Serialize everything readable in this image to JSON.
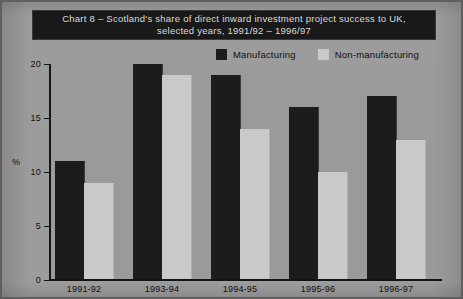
{
  "figure": {
    "title_lines": [
      "Chart 8 – Scotland's share of direct inward investment project success to UK,",
      "selected years, 1991/92 – 1996/97"
    ],
    "background_color": "#9c9c9c",
    "title_band_color": "#191919",
    "title_text_color": "#d9d9d9"
  },
  "chart_data": {
    "type": "bar",
    "title": "Chart 8 – Scotland's share of direct inward investment project success to UK, selected years, 1991/92 – 1996/97",
    "xlabel": "",
    "ylabel": "%",
    "ylim": [
      0,
      20
    ],
    "yticks": [
      0,
      5,
      10,
      15,
      20
    ],
    "ytick_labels": [
      "0",
      "5",
      "10",
      "15",
      "20"
    ],
    "grid": false,
    "legend_position": "top-right",
    "categories": [
      "1991-92",
      "1993-94",
      "1994-95",
      "1995-96",
      "1996-97"
    ],
    "series": [
      {
        "name": "Manufacturing",
        "color": "#1c1c1c",
        "values": [
          11,
          20,
          19,
          16,
          17
        ]
      },
      {
        "name": "Non-manufacturing",
        "color": "#c9c9c9",
        "values": [
          9,
          19,
          14,
          10,
          13
        ]
      }
    ]
  }
}
